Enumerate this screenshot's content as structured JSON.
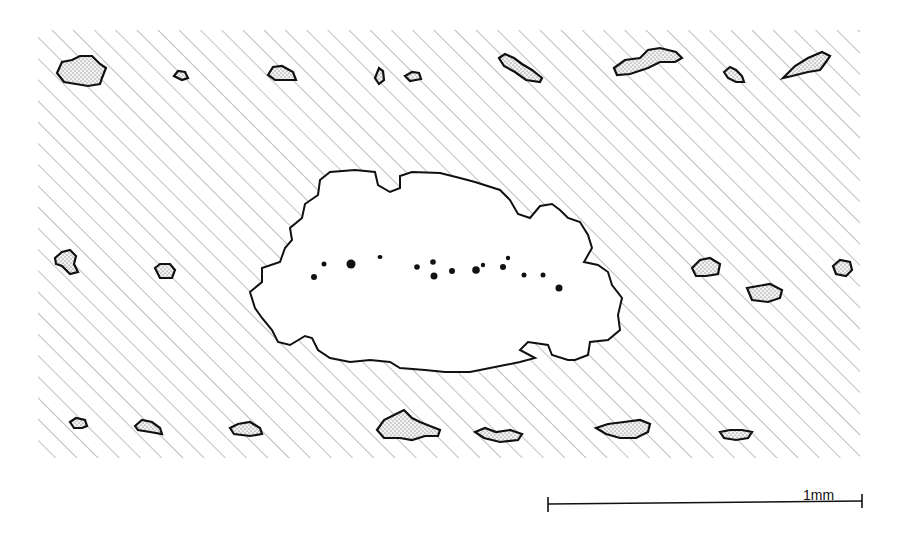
{
  "figure": {
    "hatch": {
      "region": [
        38,
        30,
        860,
        458
      ],
      "angle_deg": 45,
      "spacing_px": 15,
      "color": "#8a8a8a"
    },
    "central_void": {
      "label": "cleared zone",
      "color": "#ffffff",
      "outline": "#111111"
    },
    "inclusion_fill": "stippled",
    "inclusion_count": 21,
    "dark_particle_count": 15
  },
  "scale_bar": {
    "label": "1mm",
    "x_start": 548,
    "x_end": 862,
    "y": 503
  }
}
